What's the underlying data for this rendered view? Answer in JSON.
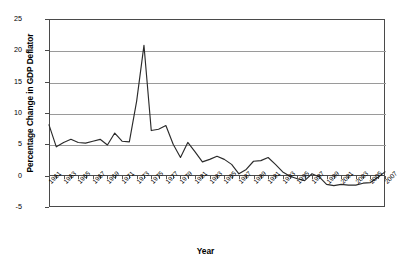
{
  "chart_data": {
    "type": "line",
    "title": "",
    "xlabel": "Year",
    "ylabel": "Percentage Change in GDP Deflator",
    "ylim": [
      -5,
      25
    ],
    "yticks": [
      25,
      20,
      15,
      10,
      5,
      0,
      -5
    ],
    "grid": true,
    "legend": "none",
    "xlim": [
      1961,
      2007
    ],
    "x_tick_step": 2,
    "xtick_labels": [
      "1961",
      "1963",
      "1965",
      "1967",
      "1969",
      "1971",
      "1973",
      "1975",
      "1977",
      "1979",
      "1981",
      "1983",
      "1985",
      "1987",
      "1989",
      "1991",
      "1993",
      "1995",
      "1997",
      "1999",
      "2001",
      "2003",
      "2005",
      "2007"
    ],
    "line_color": "#2b2b2b",
    "grid_color": "#9a9a9a",
    "axis_color": "#4a4a4a",
    "x": [
      1961,
      1962,
      1963,
      1964,
      1965,
      1966,
      1967,
      1968,
      1969,
      1970,
      1971,
      1972,
      1973,
      1974,
      1975,
      1976,
      1977,
      1978,
      1979,
      1980,
      1981,
      1982,
      1983,
      1984,
      1985,
      1986,
      1987,
      1988,
      1989,
      1990,
      1991,
      1992,
      1993,
      1994,
      1995,
      1996,
      1997,
      1998,
      1999,
      2000,
      2001,
      2002,
      2003,
      2004,
      2005,
      2006,
      2007
    ],
    "values": [
      8.1,
      4.6,
      5.3,
      5.8,
      5.3,
      5.2,
      5.5,
      5.8,
      4.9,
      6.8,
      5.5,
      5.4,
      11.9,
      20.8,
      7.2,
      7.4,
      8.0,
      5.0,
      2.9,
      5.3,
      3.8,
      2.2,
      2.6,
      3.1,
      2.6,
      1.8,
      0.3,
      1.0,
      2.3,
      2.4,
      2.9,
      1.8,
      0.6,
      -0.1,
      -0.5,
      -0.8,
      0.3,
      -0.2,
      -1.4,
      -1.6,
      -1.4,
      -1.5,
      -1.5,
      -1.2,
      -1.1,
      -0.3,
      0.6
    ]
  },
  "axis": {
    "y_title": "Percentage Change in GDP Deflator",
    "x_title": "Year"
  }
}
